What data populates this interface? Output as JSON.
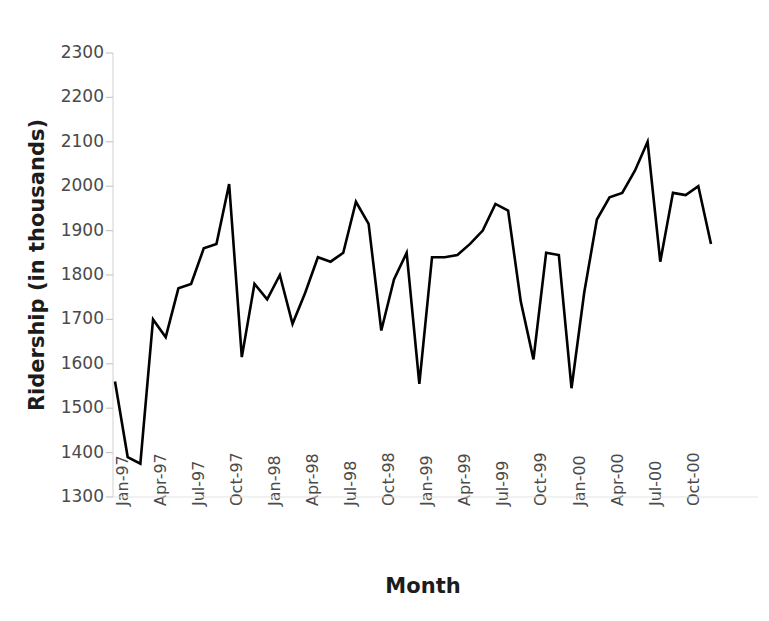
{
  "chart_data": {
    "type": "line",
    "title": "",
    "xlabel": "Month",
    "ylabel": "Ridership (in thousands)",
    "ylim": [
      1300,
      2300
    ],
    "ytick_step": 100,
    "yticks": [
      2300,
      2200,
      2100,
      2000,
      1900,
      1800,
      1700,
      1600,
      1500,
      1400,
      1300
    ],
    "grid": false,
    "legend": false,
    "line_color": "#000000",
    "axis_color": "#d9d9d9",
    "tick_label_color": "#4a4a4a",
    "title_color": "#1c1c1c",
    "xtick_labels": [
      "Jan-97",
      "Apr-97",
      "Jul-97",
      "Oct-97",
      "Jan-98",
      "Apr-98",
      "Jul-98",
      "Oct-98",
      "Jan-99",
      "Apr-99",
      "Jul-99",
      "Oct-99",
      "Jan-00",
      "Apr-00",
      "Jul-00",
      "Oct-00"
    ],
    "xtick_indices": [
      0,
      3,
      6,
      9,
      12,
      15,
      18,
      21,
      24,
      27,
      30,
      33,
      36,
      39,
      42,
      45
    ],
    "x": [
      "Jan-97",
      "Feb-97",
      "Mar-97",
      "Apr-97",
      "May-97",
      "Jun-97",
      "Jul-97",
      "Aug-97",
      "Sep-97",
      "Oct-97",
      "Nov-97",
      "Dec-97",
      "Jan-98",
      "Feb-98",
      "Mar-98",
      "Apr-98",
      "May-98",
      "Jun-98",
      "Jul-98",
      "Aug-98",
      "Sep-98",
      "Oct-98",
      "Nov-98",
      "Dec-98",
      "Jan-99",
      "Feb-99",
      "Mar-99",
      "Apr-99",
      "May-99",
      "Jun-99",
      "Jul-99",
      "Aug-99",
      "Sep-99",
      "Oct-99",
      "Nov-99",
      "Dec-99",
      "Jan-00",
      "Feb-00",
      "Mar-00",
      "Apr-00",
      "May-00",
      "Jun-00",
      "Jul-00",
      "Aug-00",
      "Sep-00",
      "Oct-00",
      "Nov-00",
      "Dec-00"
    ],
    "values": [
      1560,
      1390,
      1375,
      1700,
      1660,
      1770,
      1780,
      1860,
      1870,
      2005,
      1615,
      1780,
      1745,
      1800,
      1690,
      1760,
      1840,
      1830,
      1850,
      1965,
      1915,
      1675,
      1790,
      1850,
      1555,
      1840,
      1840,
      1845,
      1870,
      1900,
      1960,
      1945,
      1740,
      1610,
      1850,
      1845,
      1545,
      1760,
      1925,
      1975,
      1985,
      2035,
      2100,
      1830,
      1985,
      1980,
      2000,
      1870
    ]
  }
}
